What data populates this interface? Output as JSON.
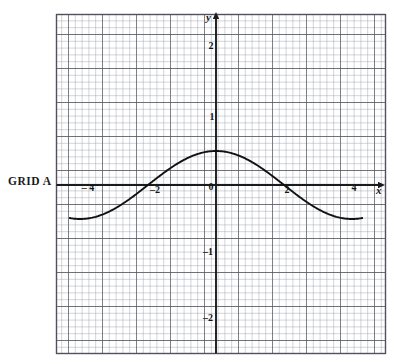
{
  "figure": {
    "caption": "GRID A",
    "background": "#ffffff"
  },
  "axes": {
    "x_name": "y",
    "y_name": "x",
    "x_axis_label": "x",
    "y_axis_label": "y",
    "origin_label": "0",
    "x_ticks": [
      {
        "value": -4,
        "label": "– 4"
      },
      {
        "value": -2,
        "label": "–2"
      },
      {
        "value": 2,
        "label": "2"
      },
      {
        "value": 4,
        "label": "4"
      }
    ],
    "y_ticks": [
      {
        "value": 2,
        "label": "2"
      },
      {
        "value": 1,
        "label": "1"
      },
      {
        "value": -1,
        "label": "–1"
      },
      {
        "value": -2,
        "label": "–2"
      }
    ]
  },
  "grid": {
    "minor_color": "#8d8d94",
    "major_color": "#4a4a50",
    "axis_color": "#1b1b1b",
    "minor_step": 0.4,
    "major_step": 2,
    "border": true
  },
  "chart_data": {
    "type": "line",
    "title": "GRID A",
    "xlabel": "x",
    "ylabel": "y",
    "xlim": [
      -4.8,
      4.8
    ],
    "ylim": [
      -2.5,
      2.5
    ],
    "grid": true,
    "legend": null,
    "series": [
      {
        "name": "y = cos(pi*x/4)",
        "equation": "y = cos(πx/4)",
        "color": "#111111",
        "x_domain": [
          -4.3,
          4.3
        ],
        "x": [
          -4.3,
          -4.0,
          -3.5,
          -3.0,
          -2.5,
          -2.0,
          -1.5,
          -1.0,
          -0.5,
          0.0,
          0.5,
          1.0,
          1.5,
          2.0,
          2.5,
          3.0,
          3.5,
          4.0,
          4.3
        ],
        "y": [
          -0.99,
          -1.0,
          -0.92,
          -0.71,
          -0.38,
          0.0,
          0.38,
          0.71,
          0.92,
          1.0,
          0.92,
          0.71,
          0.38,
          0.0,
          -0.38,
          -0.71,
          -0.92,
          -1.0,
          -0.99
        ],
        "key_points": {
          "maximum": {
            "x": 0,
            "y": 1
          },
          "zeros": [
            -2,
            2
          ],
          "minima": [
            {
              "x": -4,
              "y": -1
            },
            {
              "x": 4,
              "y": -1
            }
          ]
        }
      }
    ]
  },
  "labels": {
    "grid_a": "GRID A"
  }
}
